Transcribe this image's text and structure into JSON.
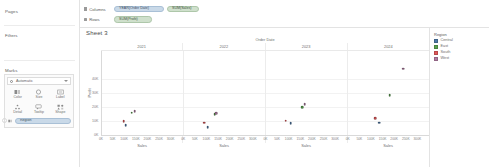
{
  "left_panel": {
    "pages_label": "Pages",
    "filters_label": "Filters",
    "marks_label": "Marks",
    "mark_type": {
      "value": "Automatic",
      "icon": "circle-mark-icon",
      "chevron": "chevron-down-icon"
    },
    "buttons": [
      {
        "label": "Color",
        "icon": "color-palette-icon"
      },
      {
        "label": "Size",
        "icon": "size-icon"
      },
      {
        "label": "Label",
        "icon": "label-icon"
      },
      {
        "label": "Detail",
        "icon": "detail-icon"
      },
      {
        "label": "Tooltip",
        "icon": "tooltip-icon"
      },
      {
        "label": "Shape",
        "icon": "shape-icon"
      }
    ],
    "color_shelf": {
      "icon": "color-palette-icon",
      "pill": "Region"
    }
  },
  "shelves": {
    "columns_label": "Columns",
    "rows_label": "Rows",
    "columns_pills": [
      {
        "text": "YEAR(Order Date)",
        "type": "blue"
      },
      {
        "text": "SUM(Sales)",
        "type": "green"
      }
    ],
    "rows_pills": [
      {
        "text": "SUM(Profit)",
        "type": "green"
      }
    ]
  },
  "sheet": {
    "title": "Sheet 3"
  },
  "legend": {
    "title": "Region",
    "items": [
      {
        "label": "Central",
        "color": "#4e79a7"
      },
      {
        "label": "East",
        "color": "#59a14f"
      },
      {
        "label": "South",
        "color": "#e15759"
      },
      {
        "label": "West",
        "color": "#b07aa1"
      }
    ]
  },
  "chart_data": {
    "type": "scatter",
    "title": "Sheet 3",
    "column_title": "Order Date",
    "xlabel": "Sales",
    "ylabel": "Profit",
    "facet_field": "YEAR(Order Date)",
    "facets": [
      "2021",
      "2022",
      "2023",
      "2024"
    ],
    "color_field": "Region",
    "grid": true,
    "legend_position": "right",
    "ylim": [
      0,
      60000
    ],
    "yticks": [
      0,
      10000,
      20000,
      30000,
      40000
    ],
    "ytick_labels": [
      "0K",
      "10K",
      "20K",
      "30K",
      "40K"
    ],
    "xlim": [
      0,
      350000
    ],
    "xticks": [
      0,
      50000,
      100000,
      150000,
      200000,
      250000,
      300000
    ],
    "xtick_labels": [
      "0K",
      "50K",
      "100K",
      "150K",
      "200K",
      "250K",
      "300K"
    ],
    "series": [
      {
        "name": "Central",
        "color": "#4e79a7",
        "points": [
          {
            "facet": "2021",
            "x": 103000,
            "y": 6500
          },
          {
            "facet": "2022",
            "x": 102000,
            "y": 5200
          },
          {
            "facet": "2023",
            "x": 106000,
            "y": 8200
          },
          {
            "facet": "2024",
            "x": 135000,
            "y": 8500
          }
        ]
      },
      {
        "name": "East",
        "color": "#59a14f",
        "points": [
          {
            "facet": "2021",
            "x": 128000,
            "y": 15500
          },
          {
            "facet": "2022",
            "x": 132000,
            "y": 14500
          },
          {
            "facet": "2023",
            "x": 157000,
            "y": 19500
          },
          {
            "facet": "2024",
            "x": 180000,
            "y": 28000
          }
        ]
      },
      {
        "name": "South",
        "color": "#e15759",
        "points": [
          {
            "facet": "2021",
            "x": 94000,
            "y": 9500
          },
          {
            "facet": "2022",
            "x": 88000,
            "y": 8500
          },
          {
            "facet": "2023",
            "x": 86000,
            "y": 9800
          },
          {
            "facet": "2024",
            "x": 117000,
            "y": 11500
          }
        ]
      },
      {
        "name": "West",
        "color": "#b07aa1",
        "points": [
          {
            "facet": "2021",
            "x": 141000,
            "y": 16500
          },
          {
            "facet": "2022",
            "x": 138000,
            "y": 15200
          },
          {
            "facet": "2023",
            "x": 168000,
            "y": 21500
          },
          {
            "facet": "2024",
            "x": 238000,
            "y": 47000
          }
        ]
      }
    ]
  }
}
